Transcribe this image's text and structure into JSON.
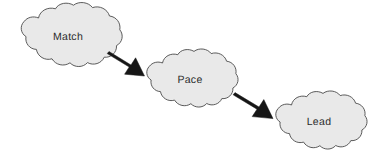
{
  "diagram": {
    "canvas": {
      "width": 377,
      "height": 155,
      "background": "#ffffff"
    },
    "style": {
      "node_fill": "#e9e9e9",
      "node_stroke": "#4a4a4a",
      "arrow_fill": "#161616",
      "label_color": "#2b2b2b"
    },
    "nodes": [
      {
        "id": "match",
        "label": "Match",
        "shape": "cloud",
        "center_x": 68,
        "center_y": 37,
        "width": 105,
        "height": 62
      },
      {
        "id": "pace",
        "label": "Pace",
        "shape": "cloud",
        "center_x": 190,
        "center_y": 80,
        "width": 96,
        "height": 57
      },
      {
        "id": "lead",
        "label": "Lead",
        "shape": "cloud",
        "center_x": 319,
        "center_y": 122,
        "width": 96,
        "height": 57
      }
    ],
    "edges": [
      {
        "id": "match-to-pace",
        "from": "match",
        "to": "pace",
        "style": "block-arrow",
        "direction": "down-right"
      },
      {
        "id": "pace-to-lead",
        "from": "pace",
        "to": "lead",
        "style": "block-arrow",
        "direction": "down-right"
      }
    ]
  }
}
